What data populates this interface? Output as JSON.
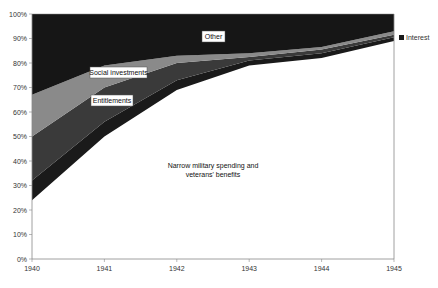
{
  "chart_data": {
    "type": "area",
    "stacked": true,
    "normalized": true,
    "title": "",
    "xlabel": "",
    "ylabel": "",
    "x": [
      1940,
      1941,
      1942,
      1943,
      1944,
      1945
    ],
    "ylim": [
      0,
      100
    ],
    "y_ticks": [
      "0%",
      "10%",
      "20%",
      "30%",
      "40%",
      "50%",
      "60%",
      "70%",
      "80%",
      "90%",
      "100%"
    ],
    "x_ticks": [
      "1940",
      "1941",
      "1942",
      "1943",
      "1944",
      "1945"
    ],
    "grid": false,
    "series": [
      {
        "name": "Narrow military spending and veterans' benefits",
        "color": "#ffffff",
        "values": [
          24,
          50,
          69,
          79,
          82,
          89
        ]
      },
      {
        "name": "Interest",
        "color": "#1a1a1a",
        "values": [
          8,
          6,
          4,
          2,
          2,
          1.5
        ]
      },
      {
        "name": "Entitlements",
        "color": "#3a3a3a",
        "values": [
          18,
          14,
          7,
          1.5,
          1.5,
          1
        ]
      },
      {
        "name": "Social investments",
        "color": "#8a8a8a",
        "values": [
          17,
          9,
          3,
          1.5,
          1,
          1.5
        ]
      },
      {
        "name": "Other",
        "color": "#161616",
        "values": [
          33,
          21,
          17,
          16,
          13.5,
          7
        ]
      }
    ],
    "legend": {
      "position": "right",
      "entries": [
        "Interest"
      ]
    },
    "annotations": [
      "Other",
      "Social investments",
      "Entitlements",
      "Narrow military spending and veterans' benefits"
    ]
  },
  "labels": {
    "other": "Other",
    "social": "Social investments",
    "entitlements": "Entitlements",
    "narrow_line1": "Narrow military spending and",
    "narrow_line2": "veterans' benefits",
    "legend_interest": "Interest"
  }
}
